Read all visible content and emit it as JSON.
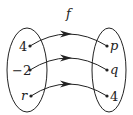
{
  "diagram": {
    "type": "function-mapping",
    "function_label": "f",
    "domain": [
      "4",
      "−2",
      "r"
    ],
    "codomain": [
      "p",
      "q",
      "4"
    ],
    "mappings": [
      {
        "from": "4",
        "to": "p"
      },
      {
        "from": "−2",
        "to": "q"
      },
      {
        "from": "r",
        "to": "4"
      }
    ],
    "colors": {
      "stroke": "#222222",
      "background": "#ffffff"
    }
  }
}
